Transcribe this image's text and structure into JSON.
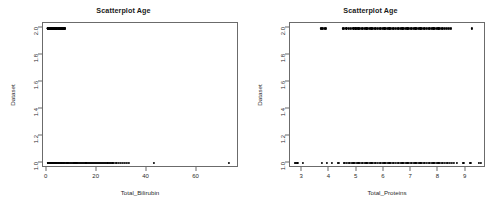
{
  "figure": {
    "background": "#ffffff",
    "point_color": "#000000",
    "axis_color": "#6b6b6b",
    "panel_count": 2
  },
  "chart_data": [
    {
      "type": "scatter",
      "panel": "left",
      "title": "Scatterplot Age",
      "xlabel": "Total_Bilirubin",
      "ylabel": "Dataset",
      "xlim": [
        -1.5,
        77
      ],
      "ylim": [
        0.96,
        2.04
      ],
      "xticks": [
        0,
        20,
        40,
        60
      ],
      "xtick_labels": [
        "0",
        "20",
        "40",
        "60"
      ],
      "yticks": [
        1.0,
        1.2,
        1.4,
        1.6,
        1.8,
        2.0
      ],
      "ytick_labels": [
        "1.0",
        "1.2",
        "1.4",
        "1.6",
        "1.8",
        "2.0"
      ],
      "grid": false,
      "legend": null,
      "series": [
        {
          "name": "Dataset = 2",
          "y": 2.0,
          "x": [
            0.4,
            0.5,
            0.5,
            0.6,
            0.6,
            0.6,
            0.7,
            0.7,
            0.7,
            0.7,
            0.8,
            0.8,
            0.8,
            0.8,
            0.9,
            0.9,
            0.9,
            0.9,
            0.9,
            1.0,
            1.0,
            1.0,
            1.0,
            1.0,
            1.0,
            1.1,
            1.1,
            1.1,
            1.1,
            1.2,
            1.2,
            1.2,
            1.3,
            1.3,
            1.4,
            1.5,
            1.6,
            1.7,
            1.8,
            1.9,
            2.0,
            2.1,
            2.2,
            2.3,
            2.4,
            2.6,
            2.7,
            2.8,
            3.0,
            3.2,
            3.5,
            3.7,
            3.9,
            4.2,
            4.5,
            4.8,
            5.0,
            5.2,
            5.5,
            5.8,
            6.0,
            6.2,
            6.4,
            6.6,
            6.8,
            7.0,
            7.1,
            7.3
          ]
        },
        {
          "name": "Dataset = 1",
          "y": 1.0,
          "x": [
            0.5,
            0.6,
            0.7,
            0.7,
            0.8,
            0.8,
            0.9,
            0.9,
            1.0,
            1.0,
            1.1,
            1.2,
            1.3,
            1.4,
            1.5,
            1.6,
            1.7,
            1.8,
            1.9,
            2.0,
            2.2,
            2.3,
            2.5,
            2.7,
            2.9,
            3.0,
            3.2,
            3.5,
            3.7,
            4.0,
            4.2,
            4.5,
            4.8,
            5.0,
            5.3,
            5.6,
            5.9,
            6.2,
            6.5,
            6.8,
            7.0,
            7.3,
            7.6,
            8.0,
            8.3,
            8.6,
            9.0,
            9.3,
            9.6,
            10.0,
            10.4,
            10.8,
            11.1,
            11.5,
            11.9,
            12.2,
            12.6,
            13.0,
            13.4,
            13.8,
            14.2,
            14.6,
            15.0,
            15.5,
            15.9,
            16.4,
            16.8,
            17.2,
            17.7,
            18.1,
            18.6,
            19.0,
            19.4,
            19.8,
            20.2,
            20.6,
            21.0,
            21.4,
            21.8,
            22.2,
            22.6,
            23.0,
            23.4,
            23.8,
            24.3,
            24.8,
            25.2,
            25.8,
            26.3,
            27.0,
            27.6,
            28.2,
            28.8,
            29.6,
            30.4,
            31.2,
            32.0,
            32.8,
            42.8,
            73.0
          ]
        }
      ]
    },
    {
      "type": "scatter",
      "panel": "right",
      "title": "Scatterplot Age",
      "xlabel": "Total_Proteins",
      "ylabel": "Dataset",
      "xlim": [
        2.55,
        9.75
      ],
      "ylim": [
        0.96,
        2.04
      ],
      "xticks": [
        3,
        4,
        5,
        6,
        7,
        8,
        9
      ],
      "xtick_labels": [
        "3",
        "4",
        "5",
        "6",
        "7",
        "8",
        "9"
      ],
      "yticks": [
        1.0,
        1.2,
        1.4,
        1.6,
        1.8,
        2.0
      ],
      "ytick_labels": [
        "1.0",
        "1.2",
        "1.4",
        "1.6",
        "1.8",
        "2.0"
      ],
      "grid": false,
      "legend": null,
      "series": [
        {
          "name": "Dataset = 2",
          "y": 2.0,
          "x": [
            3.68,
            3.72,
            3.76,
            3.82,
            3.88,
            4.48,
            4.52,
            4.62,
            4.72,
            4.8,
            4.88,
            4.95,
            5.0,
            5.06,
            5.12,
            5.18,
            5.24,
            5.3,
            5.36,
            5.42,
            5.48,
            5.54,
            5.6,
            5.66,
            5.72,
            5.78,
            5.84,
            5.9,
            5.96,
            6.02,
            6.08,
            6.14,
            6.2,
            6.26,
            6.32,
            6.38,
            6.44,
            6.5,
            6.56,
            6.62,
            6.68,
            6.74,
            6.8,
            6.86,
            6.92,
            6.98,
            7.04,
            7.1,
            7.16,
            7.22,
            7.28,
            7.34,
            7.4,
            7.46,
            7.52,
            7.58,
            7.64,
            7.7,
            7.76,
            7.82,
            7.88,
            7.94,
            8.0,
            8.06,
            8.12,
            8.18,
            8.24,
            8.3,
            8.38,
            8.46,
            9.22
          ]
        },
        {
          "name": "Dataset = 1",
          "y": 1.0,
          "x": [
            2.72,
            2.76,
            2.82,
            3.02,
            3.72,
            3.9,
            4.08,
            4.3,
            4.36,
            4.52,
            4.58,
            4.64,
            4.7,
            4.76,
            4.82,
            4.88,
            4.94,
            5.0,
            5.06,
            5.12,
            5.18,
            5.24,
            5.3,
            5.36,
            5.42,
            5.48,
            5.54,
            5.6,
            5.66,
            5.72,
            5.78,
            5.84,
            5.9,
            5.96,
            6.02,
            6.08,
            6.14,
            6.2,
            6.26,
            6.32,
            6.38,
            6.44,
            6.5,
            6.56,
            6.62,
            6.68,
            6.74,
            6.8,
            6.86,
            6.92,
            6.98,
            7.04,
            7.1,
            7.16,
            7.22,
            7.28,
            7.34,
            7.4,
            7.46,
            7.52,
            7.58,
            7.64,
            7.7,
            7.76,
            7.82,
            7.88,
            7.94,
            8.0,
            8.06,
            8.12,
            8.18,
            8.24,
            8.3,
            8.36,
            8.42,
            8.5,
            8.58,
            8.68,
            8.92,
            9.18,
            9.5,
            9.56
          ]
        }
      ]
    }
  ]
}
